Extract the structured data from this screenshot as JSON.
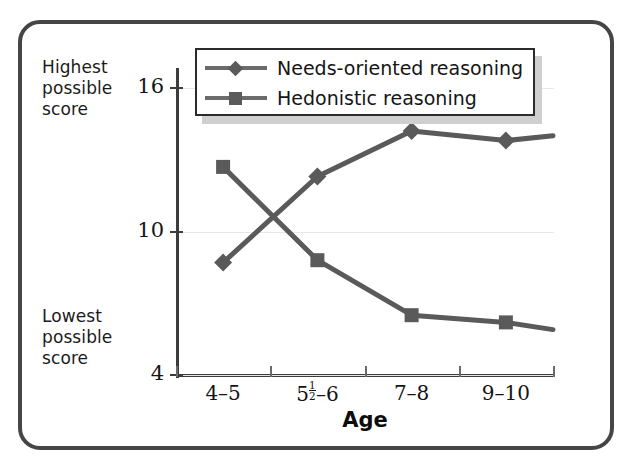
{
  "figure": {
    "border_color": "#454545",
    "background": "#ffffff"
  },
  "axis_annotations": {
    "highest": "Highest\npossible\nscore",
    "lowest": "Lowest\npossible\nscore"
  },
  "legend": {
    "entries": [
      {
        "label": "Needs-oriented reasoning",
        "marker": "diamond-marker",
        "color": "#5a5a5a"
      },
      {
        "label": "Hedonistic reasoning",
        "marker": "square-marker",
        "color": "#5a5a5a"
      }
    ]
  },
  "chart_data": {
    "type": "line",
    "title": "",
    "subtitle": "",
    "xlabel": "Age",
    "ylabel": "",
    "categories": [
      "4-5",
      "5½-6",
      "7-8",
      "9-10"
    ],
    "category_labels_raw": [
      "4–5",
      "5|1|2–6",
      "7–8",
      "9–10"
    ],
    "ylim": [
      4,
      16
    ],
    "yticks": [
      4,
      10,
      16
    ],
    "ytick_labels": [
      "4",
      "10",
      "16"
    ],
    "grid": true,
    "grid_axis": "y",
    "legend_position": "top-center",
    "series": [
      {
        "name": "Needs-oriented reasoning",
        "marker": "diamond",
        "color": "#5a5a5a",
        "values": [
          8.7,
          12.3,
          14.2,
          13.8
        ],
        "extends_to_edge": true,
        "edge_value": 14.0
      },
      {
        "name": "Hedonistic reasoning",
        "marker": "square",
        "color": "#5a5a5a",
        "values": [
          12.7,
          8.8,
          6.5,
          6.2
        ],
        "extends_to_edge": true,
        "edge_value": 5.9
      }
    ],
    "annotations": [
      "Highest possible score",
      "Lowest possible score"
    ]
  }
}
